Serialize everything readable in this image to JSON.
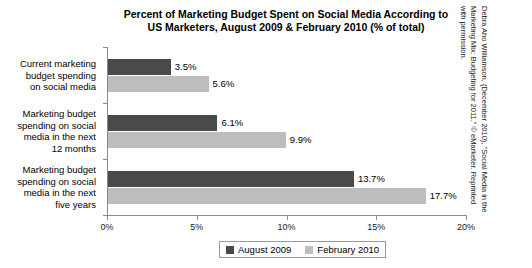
{
  "chart_data": {
    "type": "bar",
    "orientation": "horizontal",
    "title": "Percent of Marketing Budget Spent on Social Media According to US Marketers, August 2009 & February 2010 (% of total)",
    "title_lines": [
      "Percent of Marketing Budget Spent on Social Media According to",
      "US Marketers, August 2009 & February 2010 (% of total)"
    ],
    "categories": [
      "Current marketing budget spending on social media",
      "Marketing budget spending on social media in the next 12 months",
      "Marketing budget spending on social media in the next five years"
    ],
    "category_lines": [
      [
        "Current marketing",
        "budget spending",
        "on social media"
      ],
      [
        "Marketing budget",
        "spending on social",
        "media in the next",
        "12 months"
      ],
      [
        "Marketing budget",
        "spending on social",
        "media in the next",
        "five years"
      ]
    ],
    "series": [
      {
        "name": "August 2009",
        "color": "#4a4a4a",
        "values": [
          3.5,
          6.1,
          13.7
        ],
        "labels": [
          "3.5%",
          "6.1%",
          "13.7%"
        ]
      },
      {
        "name": "February 2010",
        "color": "#bdbdbd",
        "values": [
          5.6,
          9.9,
          17.7
        ],
        "labels": [
          "5.6%",
          "9.9%",
          "17.7%"
        ]
      }
    ],
    "xlabel": "",
    "ylabel": "",
    "xlim": [
      0,
      20
    ],
    "xticks": [
      0,
      5,
      10,
      15,
      20
    ],
    "xtick_labels": [
      "0%",
      "5%",
      "10%",
      "15%",
      "20%"
    ],
    "grid": false,
    "legend_position": "bottom"
  },
  "legend": {
    "items": [
      {
        "label": "August 2009",
        "color": "#4a4a4a"
      },
      {
        "label": "February 2010",
        "color": "#bdbdbd"
      }
    ]
  },
  "source_note": {
    "lines": [
      "Debra Aho Williamson, (December 2010), \"Social Media in the",
      "Marketing Mix: Budgeting for 2011.\" © eMarketer. Reprinted",
      "with permission."
    ],
    "text": "Debra Aho Williamson, (December 2010), \"Social Media in the Marketing Mix: Budgeting for 2011.\" © eMarketer. Reprinted with permission."
  }
}
